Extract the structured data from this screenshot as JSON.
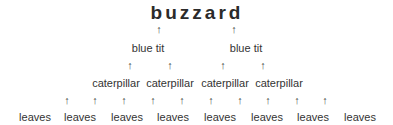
{
  "diagram": {
    "type": "food chain / food web",
    "levels": [
      {
        "name": "top_predator",
        "items": [
          "buzzard"
        ]
      },
      {
        "name": "secondary_consumers",
        "items": [
          "blue tit",
          "blue tit"
        ]
      },
      {
        "name": "primary_consumers",
        "items": [
          "caterpillar",
          "caterpillar",
          "caterpillar",
          "caterpillar"
        ]
      },
      {
        "name": "producers",
        "items": [
          "leaves",
          "leaves",
          "leaves",
          "leaves",
          "leaves",
          "leaves",
          "leaves",
          "leaves"
        ]
      }
    ],
    "arrow_glyph": "↑"
  }
}
